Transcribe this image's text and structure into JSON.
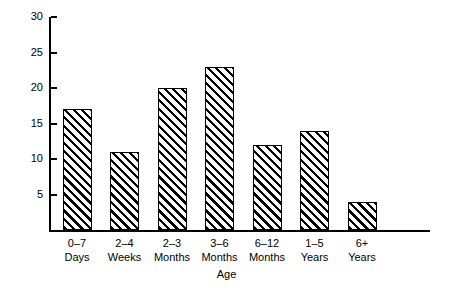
{
  "chart_data": {
    "type": "bar",
    "title": "",
    "xlabel": "Age",
    "ylabel": "Number of Patients",
    "categories": [
      "0–7 Days",
      "2–4 Weeks",
      "2–3 Months",
      "3–6 Months",
      "6–12 Months",
      "1–5 Years",
      "6+ Years"
    ],
    "category_lines": [
      {
        "line1": "0–7",
        "line2": "Days"
      },
      {
        "line1": "2–4",
        "line2": "Weeks"
      },
      {
        "line1": "2–3",
        "line2": "Months"
      },
      {
        "line1": "3–6",
        "line2": "Months"
      },
      {
        "line1": "6–12",
        "line2": "Months"
      },
      {
        "line1": "1–5",
        "line2": "Years"
      },
      {
        "line1": "6+",
        "line2": "Years"
      }
    ],
    "values": [
      17,
      11,
      20,
      23,
      12,
      14,
      4
    ],
    "ylim": [
      0,
      30
    ],
    "yticks": [
      5,
      10,
      15,
      20,
      25,
      30
    ],
    "ytick_labels": [
      "5",
      "10",
      "15",
      "20",
      "25",
      "30"
    ],
    "grid": false,
    "legend": false,
    "bar_fill": "diagonal-hatch",
    "bar_edge_color": "#000000",
    "background_color": "#ffffff"
  }
}
